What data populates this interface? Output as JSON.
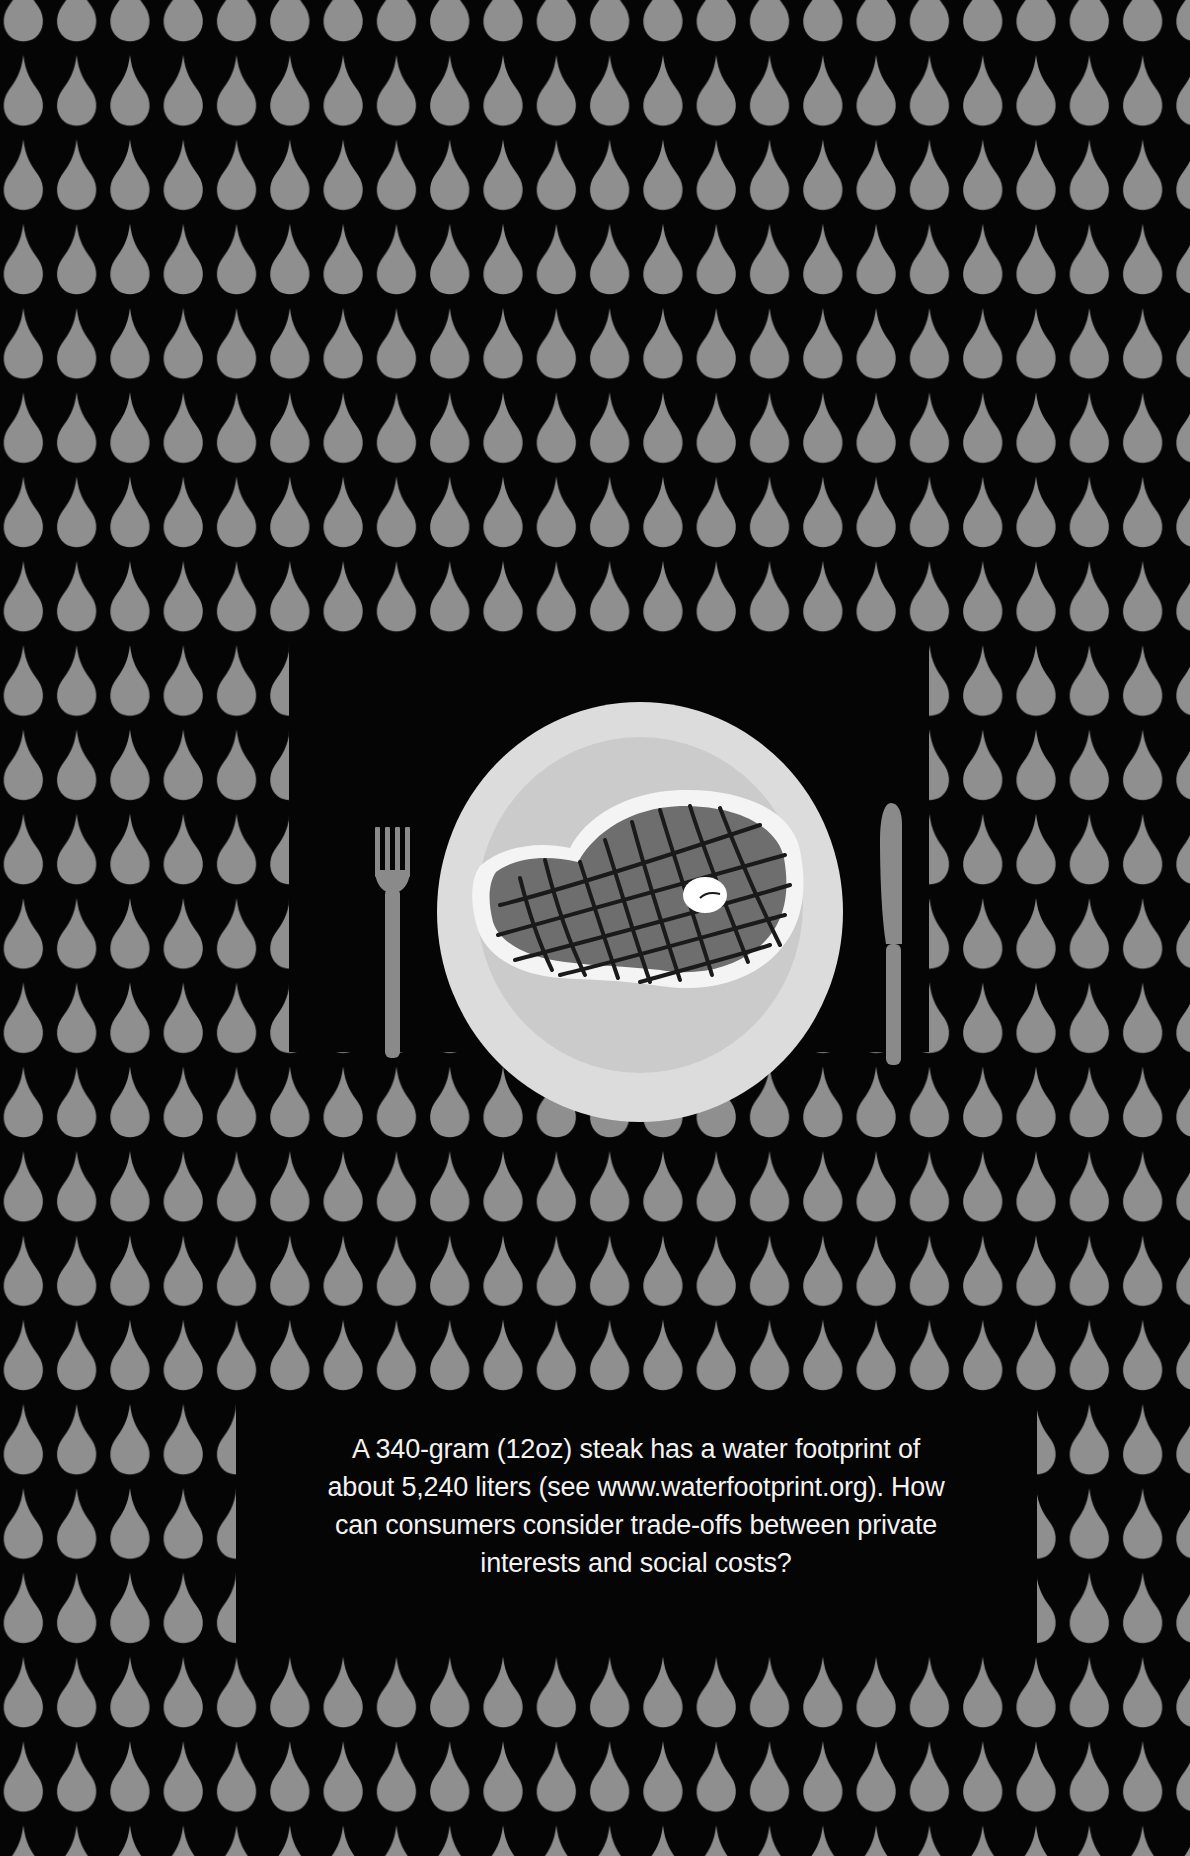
{
  "illustration": {
    "background_color": "#050505",
    "drop_pattern": {
      "drop_icon": "water-drop-icon",
      "drop_color": "#8f8f8f",
      "column_pitch_px": 53.3,
      "row_pitch_px": 84.3
    },
    "place_setting": {
      "plate_icon": "plate-icon",
      "steak_icon": "grilled-steak-icon",
      "fork_icon": "fork-icon",
      "knife_icon": "knife-icon",
      "plate_rim_color": "#dcdcdc",
      "plate_well_color": "#cbcbcb",
      "steak_fat_color": "#f4f4f4",
      "steak_meat_color": "#6e6e6e",
      "grill_mark_color": "#1a1a1a",
      "cutlery_color": "#8a8a8a"
    }
  },
  "caption": {
    "lines": [
      "A 340-gram (12oz) steak has a water footprint of",
      "about 5,240 liters (see www.waterfootprint.org). How",
      "can consumers consider trade-offs between private",
      "interests and social costs?"
    ],
    "text_color": "#f2f2f2"
  }
}
